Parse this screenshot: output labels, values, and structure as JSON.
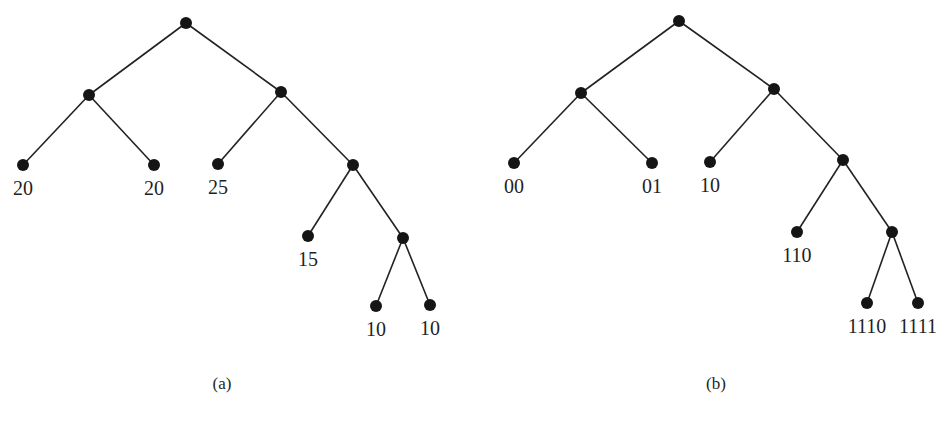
{
  "figure": {
    "panels": [
      {
        "id": "a",
        "label": "(a)",
        "label_pos": [
          222,
          389
        ],
        "description": "Binary tree with leaf weights",
        "nodes": [
          {
            "id": "a-root",
            "x": 186,
            "y": 23,
            "label": ""
          },
          {
            "id": "a-L",
            "x": 89,
            "y": 95,
            "label": ""
          },
          {
            "id": "a-R",
            "x": 281,
            "y": 92,
            "label": ""
          },
          {
            "id": "a-LL",
            "x": 23,
            "y": 165,
            "label": "20"
          },
          {
            "id": "a-LR",
            "x": 154,
            "y": 165,
            "label": "20"
          },
          {
            "id": "a-RL",
            "x": 218,
            "y": 164,
            "label": "25"
          },
          {
            "id": "a-RR",
            "x": 353,
            "y": 165,
            "label": ""
          },
          {
            "id": "a-RRL",
            "x": 308,
            "y": 236,
            "label": "15"
          },
          {
            "id": "a-RRR",
            "x": 403,
            "y": 238,
            "label": ""
          },
          {
            "id": "a-RRRL",
            "x": 376,
            "y": 306,
            "label": "10"
          },
          {
            "id": "a-RRRR",
            "x": 430,
            "y": 305,
            "label": "10"
          }
        ],
        "edges": [
          [
            "a-root",
            "a-L"
          ],
          [
            "a-root",
            "a-R"
          ],
          [
            "a-L",
            "a-LL"
          ],
          [
            "a-L",
            "a-LR"
          ],
          [
            "a-R",
            "a-RL"
          ],
          [
            "a-R",
            "a-RR"
          ],
          [
            "a-RR",
            "a-RRL"
          ],
          [
            "a-RR",
            "a-RRR"
          ],
          [
            "a-RRR",
            "a-RRRL"
          ],
          [
            "a-RRR",
            "a-RRRR"
          ]
        ]
      },
      {
        "id": "b",
        "label": "(b)",
        "label_pos": [
          716,
          389
        ],
        "description": "Same binary tree with prefix codes",
        "nodes": [
          {
            "id": "b-root",
            "x": 679,
            "y": 21,
            "label": ""
          },
          {
            "id": "b-L",
            "x": 581,
            "y": 93,
            "label": ""
          },
          {
            "id": "b-R",
            "x": 774,
            "y": 89,
            "label": ""
          },
          {
            "id": "b-LL",
            "x": 514,
            "y": 163,
            "label": "00"
          },
          {
            "id": "b-LR",
            "x": 652,
            "y": 163,
            "label": "01"
          },
          {
            "id": "b-RL",
            "x": 710,
            "y": 162,
            "label": "10"
          },
          {
            "id": "b-RR",
            "x": 843,
            "y": 160,
            "label": ""
          },
          {
            "id": "b-RRL",
            "x": 797,
            "y": 232,
            "label": "110"
          },
          {
            "id": "b-RRR",
            "x": 892,
            "y": 232,
            "label": ""
          },
          {
            "id": "b-RRRL",
            "x": 867,
            "y": 303,
            "label": "1110"
          },
          {
            "id": "b-RRRR",
            "x": 918,
            "y": 303,
            "label": "1111"
          }
        ],
        "edges": [
          [
            "b-root",
            "b-L"
          ],
          [
            "b-root",
            "b-R"
          ],
          [
            "b-L",
            "b-LL"
          ],
          [
            "b-L",
            "b-LR"
          ],
          [
            "b-R",
            "b-RL"
          ],
          [
            "b-R",
            "b-RR"
          ],
          [
            "b-RR",
            "b-RRL"
          ],
          [
            "b-RR",
            "b-RRR"
          ],
          [
            "b-RRR",
            "b-RRRL"
          ],
          [
            "b-RRR",
            "b-RRRR"
          ]
        ]
      }
    ],
    "style": {
      "node_radius": 6,
      "node_color": "#151515",
      "edge_color": "#222222",
      "label_offset_y": 30
    }
  }
}
